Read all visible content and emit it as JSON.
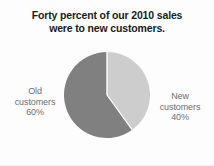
{
  "chart_data": {
    "type": "pie",
    "title": "Forty percent of our 2010 sales were to new customers.",
    "title_lines": [
      "Forty percent of our 2010 sales",
      "were to new customers."
    ],
    "categories": [
      "New customers",
      "Old customers"
    ],
    "values": [
      40,
      60
    ],
    "unit": "%",
    "start_angle_deg": 0,
    "direction": "clockwise",
    "legend": "none",
    "labels_position": "outside-sides",
    "slices": [
      {
        "name": "New customers",
        "value": 40,
        "label_lines": [
          "New",
          "customers",
          "40%"
        ],
        "color": "#cdcdcd",
        "side": "right"
      },
      {
        "name": "Old customers",
        "value": 60,
        "label_lines": [
          "Old",
          "customers",
          "60%"
        ],
        "color": "#808080",
        "side": "left"
      }
    ],
    "colors": {
      "new_customers": "#cdcdcd",
      "old_customers": "#808080",
      "title_text": "#1b1b1b",
      "label_text": "#6e6e6e",
      "background": "#fdfdfd",
      "slice_divider": "#ffffff"
    }
  }
}
